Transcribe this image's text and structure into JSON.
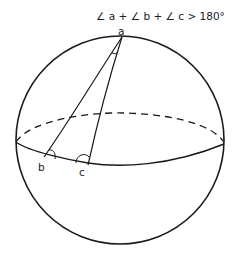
{
  "formula": {
    "text": "∠ a + ∠ b + ∠ c  > 180°"
  },
  "vertices": {
    "a": "a",
    "b": "b",
    "c": "c"
  },
  "colors": {
    "stroke": "#1a1a1a",
    "background": "#ffffff"
  }
}
